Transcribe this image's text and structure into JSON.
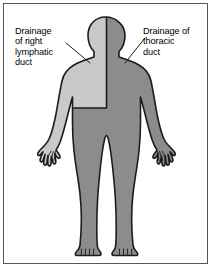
{
  "figure": {
    "type": "anatomical-diagram",
    "frame_border_color": "#58585a",
    "background_color": "#ffffff"
  },
  "labels": {
    "left": {
      "name": "right-lymphatic-duct-label",
      "text": "Drainage\nof right\nlymphatic\nduct",
      "lines": [
        "Drainage",
        "of right",
        "lymphatic",
        "duct"
      ],
      "color": "#000000"
    },
    "right": {
      "name": "thoracic-duct-label",
      "text": "Drainage of\nthoracic\nduct",
      "lines": [
        "Drainage of",
        "thoracic",
        "duct"
      ],
      "color": "#000000"
    }
  },
  "leader_lines": {
    "left": {
      "name": "leader-line-left",
      "color": "#1c1c1c"
    },
    "right": {
      "name": "leader-line-right",
      "color": "#1c1c1c"
    }
  },
  "body_regions": {
    "light": {
      "name": "right-lymphatic-drainage-region",
      "color": "#c9c9c9",
      "covers": "right side of head, right arm and hand, right upper chest"
    },
    "dark": {
      "name": "thoracic-duct-drainage-region",
      "color": "#8c8c8c",
      "covers": "left side of head, left arm and hand, lower chest, abdomen, both legs"
    },
    "outline_color": "#1c1c1c"
  }
}
